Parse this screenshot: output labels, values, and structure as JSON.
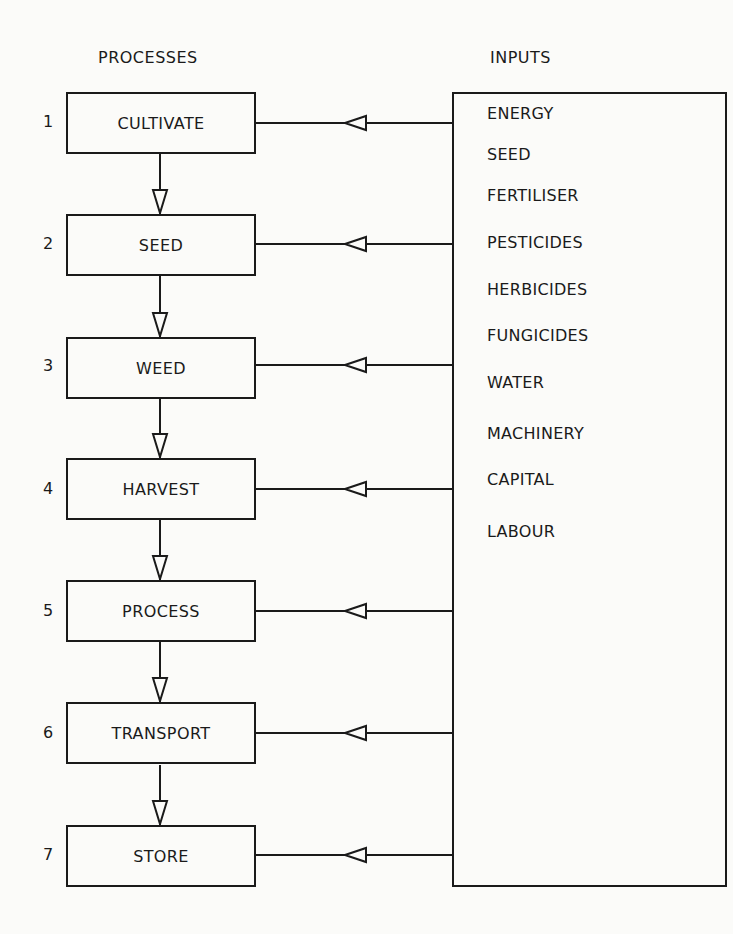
{
  "headings": {
    "processes": "PROCESSES",
    "inputs": "INPUTS"
  },
  "processes": [
    {
      "number": "1",
      "label": "CULTIVATE"
    },
    {
      "number": "2",
      "label": "SEED"
    },
    {
      "number": "3",
      "label": "WEED"
    },
    {
      "number": "4",
      "label": "HARVEST"
    },
    {
      "number": "5",
      "label": "PROCESS"
    },
    {
      "number": "6",
      "label": "TRANSPORT"
    },
    {
      "number": "7",
      "label": "STORE"
    }
  ],
  "inputs": [
    "ENERGY",
    "SEED",
    "FERTILISER",
    "PESTICIDES",
    "HERBICIDES",
    "FUNGICIDES",
    "WATER",
    "MACHINERY",
    "CAPITAL",
    "LABOUR"
  ],
  "colors": {
    "ink": "#1a1a1a",
    "paper": "#fbfbf9"
  }
}
